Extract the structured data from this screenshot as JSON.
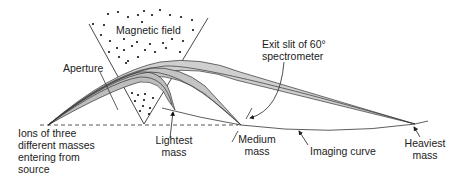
{
  "diagram": {
    "labels": {
      "magnetic_field": "Magnetic field",
      "aperture": "Aperture",
      "exit_slit_line1": "Exit slit of 60°",
      "exit_slit_line2": "spectrometer",
      "ions_line1": "Ions of three",
      "ions_line2": "different masses",
      "ions_line3": "entering from",
      "ions_line4": "source",
      "lightest_line1": "Lightest",
      "lightest_line2": "mass",
      "medium_line1": "Medium",
      "medium_line2": "mass",
      "imaging_curve": "Imaging curve",
      "heaviest_line1": "Heaviest",
      "heaviest_line2": "mass"
    },
    "colors": {
      "line": "#333333",
      "beam_fill": "#c8c8c8",
      "dot": "#111111",
      "background": "#ffffff"
    }
  }
}
